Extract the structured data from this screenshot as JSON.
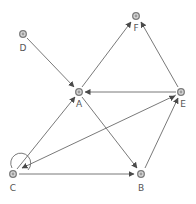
{
  "diagram": {
    "type": "directed-graph",
    "colors": {
      "edge": "#6a6a6a",
      "node_stroke": "#7a7a7a",
      "node_fill": "#d8d8d8",
      "label": "#555555"
    },
    "nodes": [
      {
        "id": "D",
        "label": "D",
        "x": 23,
        "y": 34
      },
      {
        "id": "F",
        "label": "F",
        "x": 136,
        "y": 16
      },
      {
        "id": "A",
        "label": "A",
        "x": 79,
        "y": 92
      },
      {
        "id": "E",
        "label": "E",
        "x": 181,
        "y": 92
      },
      {
        "id": "C",
        "label": "C",
        "x": 13,
        "y": 174
      },
      {
        "id": "B",
        "label": "B",
        "x": 141,
        "y": 174
      }
    ],
    "edges": [
      {
        "from": "D",
        "to": "A"
      },
      {
        "from": "A",
        "to": "F"
      },
      {
        "from": "E",
        "to": "F"
      },
      {
        "from": "E",
        "to": "A"
      },
      {
        "from": "C",
        "to": "A"
      },
      {
        "from": "E",
        "to": "C"
      },
      {
        "from": "C",
        "to": "E"
      },
      {
        "from": "A",
        "to": "B"
      },
      {
        "from": "C",
        "to": "B"
      },
      {
        "from": "B",
        "to": "E"
      },
      {
        "from": "C",
        "to": "C",
        "kind": "self-loop"
      }
    ]
  }
}
